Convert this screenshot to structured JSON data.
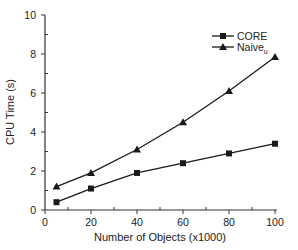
{
  "chart_data": {
    "type": "line",
    "title": "",
    "xlabel": "Number of Objects (x1000)",
    "ylabel": "CPU Time (s)",
    "x": [
      5,
      20,
      40,
      60,
      80,
      100
    ],
    "series": [
      {
        "name": "CORE",
        "marker": "square",
        "values": [
          0.4,
          1.1,
          1.9,
          2.4,
          2.9,
          3.4
        ]
      },
      {
        "name": "Naive",
        "name_subscript": "u",
        "marker": "triangle",
        "values": [
          1.2,
          1.9,
          3.1,
          4.5,
          6.1,
          7.85
        ]
      }
    ],
    "xlim": [
      0,
      100
    ],
    "ylim": [
      0,
      10
    ],
    "xticks": [
      "0",
      "20",
      "40",
      "60",
      "80",
      "100"
    ],
    "yticks": [
      "0",
      "2",
      "4",
      "6",
      "8",
      "10"
    ],
    "grid": false,
    "legend_position": "upper-right",
    "colors": {
      "line": "#1a1a1a",
      "axis": "#333333"
    }
  }
}
